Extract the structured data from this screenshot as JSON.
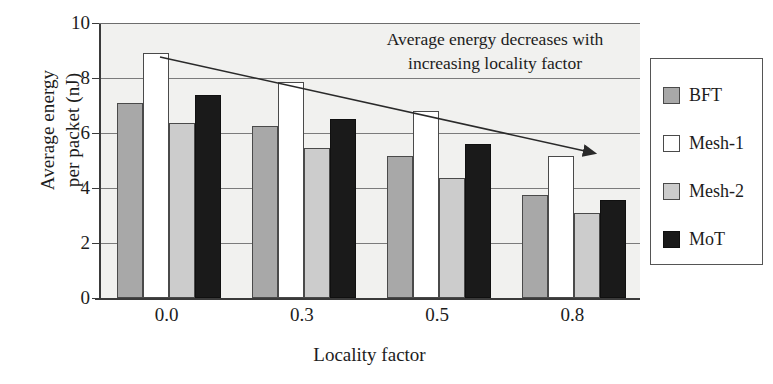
{
  "chart_data": {
    "type": "bar",
    "title": "",
    "xlabel": "Locality factor",
    "ylabel": "Average energy per packet (nJ)",
    "ylabel_line1": "Average energy",
    "ylabel_line2": "per  packet (nJ)",
    "categories": [
      "0.0",
      "0.3",
      "0.5",
      "0.8"
    ],
    "ylim": [
      0,
      10
    ],
    "yticks": [
      0,
      2,
      4,
      6,
      8,
      10
    ],
    "ytick_labels": [
      "0",
      "2",
      "4",
      "6",
      "8",
      "10"
    ],
    "grid": true,
    "legend_position": "right-outside",
    "series": [
      {
        "name": "BFT",
        "color": "#a8a8a8",
        "values": [
          7.1,
          6.25,
          5.15,
          3.75
        ]
      },
      {
        "name": "Mesh-1",
        "color": "#ffffff",
        "values": [
          8.9,
          7.85,
          6.8,
          5.15
        ]
      },
      {
        "name": "Mesh-2",
        "color": "#cccccc",
        "values": [
          6.35,
          5.45,
          4.35,
          3.1
        ]
      },
      {
        "name": "MoT",
        "color": "#1a1a1a",
        "values": [
          7.4,
          6.5,
          5.6,
          3.55
        ]
      }
    ],
    "annotations": [
      {
        "text_line1": "Average energy decreases with",
        "text_line2": "increasing locality factor",
        "arrow": "downward-trend-arrow"
      }
    ]
  },
  "legend": {
    "items": [
      {
        "label": "BFT",
        "swatch": "swatch-bft"
      },
      {
        "label": "Mesh-1",
        "swatch": "swatch-mesh1"
      },
      {
        "label": "Mesh-2",
        "swatch": "swatch-mesh2"
      },
      {
        "label": "MoT",
        "swatch": "swatch-mot"
      }
    ]
  }
}
